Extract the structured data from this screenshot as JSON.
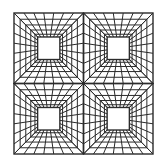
{
  "figure": {
    "width": 166,
    "height": 167,
    "background": "#ffffff",
    "stroke_color": "#2b2b2b",
    "outer_frame": {
      "x0": 14,
      "y0": 13,
      "x1": 153,
      "y1": 154
    },
    "tiles": [
      {
        "name": "top-left",
        "row": 0,
        "col": 0
      },
      {
        "name": "top-right",
        "row": 0,
        "col": 1
      },
      {
        "name": "bottom-left",
        "row": 1,
        "col": 0
      },
      {
        "name": "bottom-right",
        "row": 1,
        "col": 1
      }
    ],
    "tile_structure": {
      "inner_square_ratio": 0.32,
      "rings": 4,
      "spokes_per_side": 6
    }
  }
}
